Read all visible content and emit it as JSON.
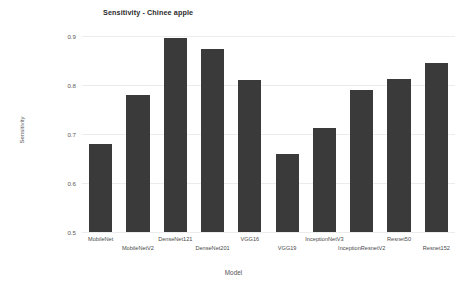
{
  "chart_data": {
    "type": "bar",
    "title": "Sensitivity - Chinee apple",
    "xlabel": "Model",
    "ylabel": "Sensitivity",
    "categories": [
      "MobileNet",
      "MobileNetV2",
      "DenseNet121",
      "DenseNet201",
      "VGG16",
      "VGG19",
      "InceptionNetV3",
      "InceptionResnetV2",
      "Resnet50",
      "Resnet152"
    ],
    "values": [
      0.68,
      0.78,
      0.895,
      0.873,
      0.81,
      0.66,
      0.712,
      0.79,
      0.813,
      0.845
    ],
    "ylim": [
      0.5,
      0.9
    ],
    "yticks": [
      "0.5",
      "0.6",
      "0.7",
      "0.8",
      "0.9"
    ],
    "ytick_values": [
      0.5,
      0.6,
      0.7,
      0.8,
      0.9
    ],
    "grid": true,
    "legend": "none",
    "bar_color": "#3a3a3a",
    "background_color": "#ffffff",
    "gridline_color": "#ececec"
  }
}
